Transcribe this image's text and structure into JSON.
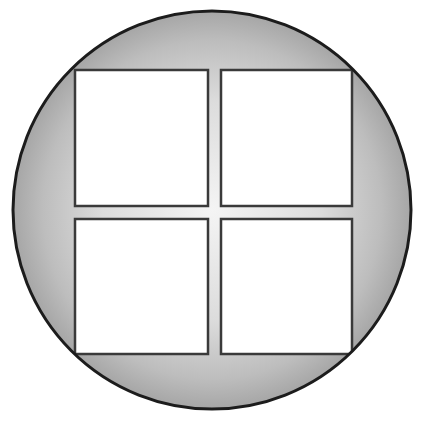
{
  "diagram": {
    "type": "circle-with-2x2-grid",
    "colors": {
      "background": "#ffffff",
      "circle_fill_center": "#f1f1f1",
      "circle_fill_edge": "#a9a9a9",
      "circle_stroke": "#1c1c1c",
      "square_fill": "#ffffff",
      "square_stroke": "#3a3a3a"
    },
    "circle": {
      "cx": 212,
      "cy": 210,
      "r": 199
    },
    "squares": [
      {
        "name": "top-left",
        "x": 75,
        "y": 70,
        "w": 133,
        "h": 136
      },
      {
        "name": "top-right",
        "x": 221,
        "y": 70,
        "w": 131,
        "h": 136
      },
      {
        "name": "bottom-left",
        "x": 75,
        "y": 219,
        "w": 133,
        "h": 135
      },
      {
        "name": "bottom-right",
        "x": 221,
        "y": 219,
        "w": 131,
        "h": 135
      }
    ]
  }
}
